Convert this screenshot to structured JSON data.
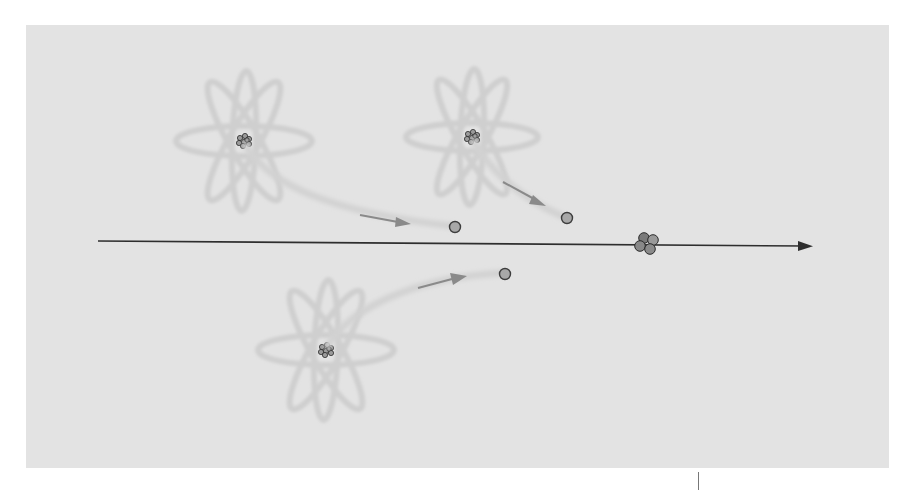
{
  "diagram": {
    "title": "",
    "colors": {
      "background": "#ffffff",
      "panel": "#e3e3e3",
      "orbit": "#cfcfcf",
      "trail": "#d2d2d2",
      "arrow_head": "#8a8a8a",
      "axis": "#2e2e2e",
      "electron_fill": "#a8a8a8",
      "electron_stroke": "#3d3d3d",
      "nucleus_fill": "#9a9a9a",
      "nucleus_stroke": "#2a2a2a",
      "cluster_fill": "#8c8c8c"
    },
    "atoms": [
      {
        "id": "atom-top-left",
        "label": ""
      },
      {
        "id": "atom-top-middle",
        "label": ""
      },
      {
        "id": "atom-bottom",
        "label": ""
      }
    ],
    "emitted_particles": [
      {
        "source": "atom-top-left",
        "direction": "toward axis, rightward"
      },
      {
        "source": "atom-top-middle",
        "direction": "toward axis, downward-right"
      },
      {
        "source": "atom-bottom",
        "direction": "toward axis, upward-right"
      }
    ],
    "axis": {
      "direction": "right",
      "label": ""
    },
    "cluster": {
      "description": "combined particle cluster on axis",
      "particle_count": 4
    }
  }
}
